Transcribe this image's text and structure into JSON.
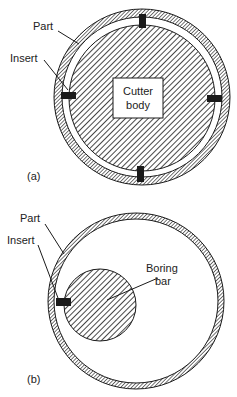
{
  "figure_a": {
    "label_part": "Part",
    "label_insert": "Insert",
    "label_body_line1": "Cutter",
    "label_body_line2": "body",
    "caption": "(a)"
  },
  "figure_b": {
    "label_part": "Part",
    "label_insert": "Insert",
    "label_bar_line1": "Boring",
    "label_bar_line2": "bar",
    "caption": "(b)"
  },
  "colors": {
    "ink": "#1a1a1a",
    "background": "#ffffff"
  }
}
